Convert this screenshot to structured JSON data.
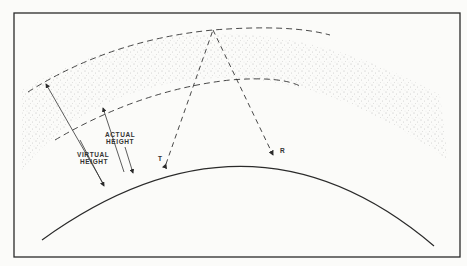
{
  "diagram": {
    "labels": {
      "actual_line1": "ACTUAL",
      "actual_line2": "HEIGHT",
      "virtual_line1": "VIRTUAL",
      "virtual_line2": "HEIGHT",
      "transmitter": "T",
      "receiver": "R"
    },
    "colors": {
      "ink": "#2a2a2a",
      "background": "#fbfbf9",
      "stipple": "#6a6a6a"
    }
  }
}
